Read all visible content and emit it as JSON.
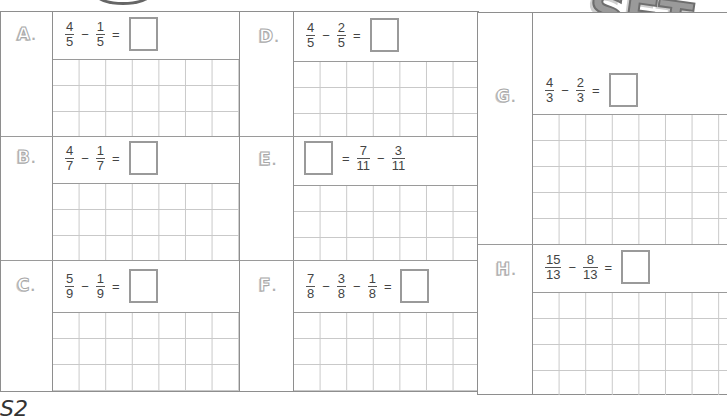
{
  "header": {
    "title_fragment": "SET",
    "title_mark": "?"
  },
  "footer": {
    "scribble": "S2"
  },
  "problems": {
    "A": {
      "letter": "A",
      "dot": ".",
      "expr": [
        {
          "t": "frac",
          "n": "4",
          "d": "5"
        },
        {
          "t": "op",
          "v": "−"
        },
        {
          "t": "frac",
          "n": "1",
          "d": "5"
        },
        {
          "t": "op",
          "v": "="
        },
        {
          "t": "box"
        }
      ],
      "grid_rows": 3,
      "grid_cols": 7
    },
    "B": {
      "letter": "B",
      "dot": ".",
      "expr": [
        {
          "t": "frac",
          "n": "4",
          "d": "7"
        },
        {
          "t": "op",
          "v": "−"
        },
        {
          "t": "frac",
          "n": "1",
          "d": "7"
        },
        {
          "t": "op",
          "v": "="
        },
        {
          "t": "box"
        }
      ],
      "grid_rows": 3,
      "grid_cols": 7
    },
    "C": {
      "letter": "C",
      "dot": ".",
      "expr": [
        {
          "t": "frac",
          "n": "5",
          "d": "9"
        },
        {
          "t": "op",
          "v": "−"
        },
        {
          "t": "frac",
          "n": "1",
          "d": "9"
        },
        {
          "t": "op",
          "v": "="
        },
        {
          "t": "box"
        }
      ],
      "grid_rows": 3,
      "grid_cols": 7
    },
    "D": {
      "letter": "D",
      "dot": ".",
      "expr": [
        {
          "t": "frac",
          "n": "4",
          "d": "5"
        },
        {
          "t": "op",
          "v": "−"
        },
        {
          "t": "frac",
          "n": "2",
          "d": "5"
        },
        {
          "t": "op",
          "v": "="
        },
        {
          "t": "box"
        }
      ],
      "grid_rows": 3,
      "grid_cols": 7
    },
    "E": {
      "letter": "E",
      "dot": ".",
      "expr": [
        {
          "t": "box"
        },
        {
          "t": "op",
          "v": "="
        },
        {
          "t": "frac",
          "n": "7",
          "d": "11"
        },
        {
          "t": "op",
          "v": "−"
        },
        {
          "t": "frac",
          "n": "3",
          "d": "11"
        }
      ],
      "grid_rows": 3,
      "grid_cols": 7
    },
    "F": {
      "letter": "F",
      "dot": ".",
      "expr": [
        {
          "t": "frac",
          "n": "7",
          "d": "8"
        },
        {
          "t": "op",
          "v": "−"
        },
        {
          "t": "frac",
          "n": "3",
          "d": "8"
        },
        {
          "t": "op",
          "v": "−"
        },
        {
          "t": "frac",
          "n": "1",
          "d": "8"
        },
        {
          "t": "op",
          "v": "="
        },
        {
          "t": "box"
        }
      ],
      "grid_rows": 3,
      "grid_cols": 7
    },
    "G": {
      "letter": "G",
      "dot": ".",
      "expr": [
        {
          "t": "frac",
          "n": "4",
          "d": "3"
        },
        {
          "t": "op",
          "v": "−"
        },
        {
          "t": "frac",
          "n": "2",
          "d": "3"
        },
        {
          "t": "op",
          "v": "="
        },
        {
          "t": "box"
        }
      ],
      "grid_rows": 5,
      "grid_cols": 7
    },
    "H": {
      "letter": "H",
      "dot": ".",
      "expr": [
        {
          "t": "frac",
          "n": "15",
          "d": "13"
        },
        {
          "t": "op",
          "v": "−"
        },
        {
          "t": "frac",
          "n": "8",
          "d": "13"
        },
        {
          "t": "op",
          "v": "="
        },
        {
          "t": "box"
        }
      ],
      "grid_rows": 5,
      "grid_cols": 7
    }
  },
  "texts": {
    "A_n1": "4",
    "A_d1": "5",
    "A_op1": "−",
    "A_n2": "1",
    "A_d2": "5",
    "A_eq": "=",
    "B_n1": "4",
    "B_d1": "7",
    "B_op1": "−",
    "B_n2": "1",
    "B_d2": "7",
    "B_eq": "=",
    "C_n1": "5",
    "C_d1": "9",
    "C_op1": "−",
    "C_n2": "1",
    "C_d2": "9",
    "C_eq": "=",
    "D_n1": "4",
    "D_d1": "5",
    "D_op1": "−",
    "D_n2": "2",
    "D_d2": "5",
    "D_eq": "=",
    "E_eq": "=",
    "E_n1": "7",
    "E_d1": "11",
    "E_op1": "−",
    "E_n2": "3",
    "E_d2": "11",
    "F_n1": "7",
    "F_d1": "8",
    "F_op1": "−",
    "F_n2": "3",
    "F_d2": "8",
    "F_op2": "−",
    "F_n3": "1",
    "F_d3": "8",
    "F_eq": "=",
    "G_n1": "4",
    "G_d1": "3",
    "G_op1": "−",
    "G_n2": "2",
    "G_d2": "3",
    "G_eq": "=",
    "H_n1": "15",
    "H_d1": "13",
    "H_op1": "−",
    "H_n2": "8",
    "H_d2": "13",
    "H_eq": "="
  }
}
